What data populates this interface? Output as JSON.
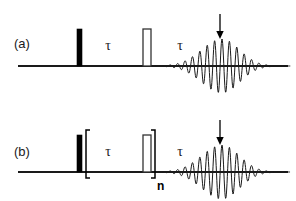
{
  "figure": {
    "kind": "nmr-pulse-sequence-diagram",
    "background_color": "#ffffff",
    "line_color": "#1a1a1a",
    "width": 296,
    "height": 201
  },
  "panels": [
    {
      "id": "a",
      "label": "(a)",
      "label_x": 14,
      "label_y": 44,
      "baseline": {
        "x1": 18,
        "x2": 288,
        "y": 66,
        "thickness": 2.2
      },
      "pulses": [
        {
          "name": "excitation-pulse",
          "style": "filled",
          "x": 77,
          "width": 5,
          "top_y": 29,
          "fill": "#000000",
          "stroke": "#000000"
        },
        {
          "name": "refocusing-pulse",
          "style": "hollow",
          "x": 143,
          "width": 8,
          "top_y": 29,
          "fill": "#ffffff",
          "stroke": "#333333"
        }
      ],
      "delays": [
        {
          "name": "tau-1",
          "label": "τ",
          "x": 108,
          "y": 49
        },
        {
          "name": "tau-2",
          "label": "τ",
          "x": 180,
          "y": 49
        }
      ],
      "arrow": {
        "name": "echo-arrow",
        "label": "",
        "x": 220,
        "top_y": 14,
        "bottom_y": 38,
        "color": "#000000"
      },
      "echo": {
        "name": "spin-echo-fid",
        "start_x": 152,
        "end_x": 290,
        "center_x": 222,
        "baseline_y": 66,
        "max_amplitude": 27,
        "period": 7.4,
        "sigma": 14,
        "stroke": "#1a1a1a"
      },
      "brackets": null
    },
    {
      "id": "b",
      "label": "(b)",
      "label_x": 14,
      "label_y": 152,
      "baseline": {
        "x1": 18,
        "x2": 288,
        "y": 172,
        "thickness": 2.2
      },
      "pulses": [
        {
          "name": "excitation-pulse",
          "style": "filled",
          "x": 77,
          "width": 5,
          "top_y": 135,
          "fill": "#000000",
          "stroke": "#000000"
        },
        {
          "name": "refocusing-pulse",
          "style": "hollow",
          "x": 143,
          "width": 8,
          "top_y": 135,
          "fill": "#ffffff",
          "stroke": "#333333"
        }
      ],
      "delays": [
        {
          "name": "tau-1",
          "label": "τ",
          "x": 108,
          "y": 155
        },
        {
          "name": "tau-2",
          "label": "τ",
          "x": 180,
          "y": 155
        }
      ],
      "arrow": {
        "name": "echo-arrow",
        "label": "",
        "x": 220,
        "top_y": 120,
        "bottom_y": 144,
        "color": "#000000"
      },
      "echo": {
        "name": "spin-echo-fid",
        "start_x": 157,
        "end_x": 290,
        "center_x": 222,
        "baseline_y": 172,
        "max_amplitude": 27,
        "period": 7.4,
        "sigma": 14,
        "stroke": "#1a1a1a"
      },
      "brackets": {
        "name": "repeat-bracket",
        "left_x": 86,
        "right_x": 155,
        "top_y": 130,
        "bottom_y": 178,
        "tick": 4,
        "stroke": "#000000",
        "repeat_label": "n",
        "repeat_label_x": 158,
        "repeat_label_y": 189
      }
    }
  ]
}
